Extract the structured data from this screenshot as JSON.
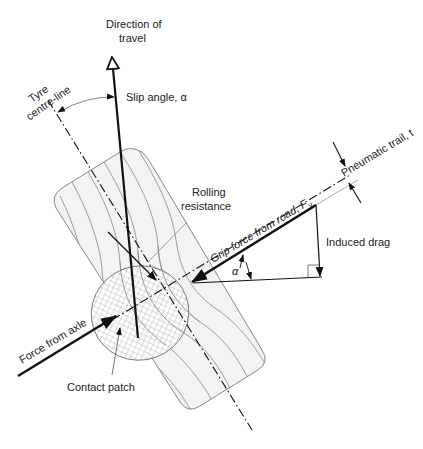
{
  "diagram": {
    "labels": {
      "direction_of_travel_line1": "Direction of",
      "direction_of_travel_line2": "travel",
      "tyre_centre_line_line1": "Tyre",
      "tyre_centre_line_line2": "centre-line",
      "slip_angle": "Slip angle, α",
      "rolling_resistance_line1": "Rolling",
      "rolling_resistance_line2": "resistance",
      "grip_force": "Grip force from road, F",
      "grip_force_subscript": "y",
      "pneumatic_trail": "Pneumatic trail, t",
      "induced_drag": "Induced drag",
      "alpha": "α",
      "force_from_axle": "Force from axle",
      "contact_patch": "Contact patch"
    },
    "colors": {
      "line": "#111111",
      "thin_line": "#777777",
      "tyre_fill": "#f2f2f2",
      "hatch": "#999999"
    }
  }
}
